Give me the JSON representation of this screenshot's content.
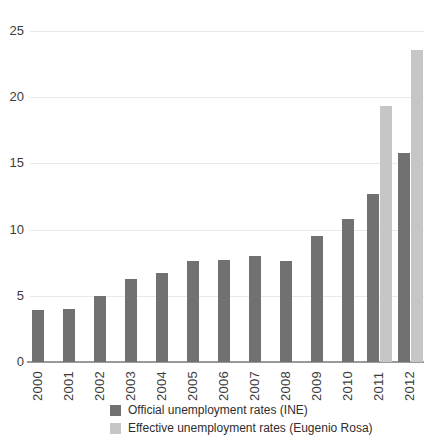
{
  "chart_data": {
    "type": "bar",
    "title": "",
    "categories": [
      "2000",
      "2001",
      "2002",
      "2003",
      "2004",
      "2005",
      "2006",
      "2007",
      "2008",
      "2009",
      "2010",
      "2011",
      "2012"
    ],
    "series": [
      {
        "name": "Official unemployment rates (INE)",
        "key": "official",
        "color": "#717171",
        "values": [
          3.9,
          4.0,
          5.0,
          6.3,
          6.7,
          7.6,
          7.7,
          8.0,
          7.6,
          9.5,
          10.8,
          12.7,
          15.8
        ]
      },
      {
        "name": "Effective unemployment rates (Eugenio Rosa)",
        "key": "effective",
        "color": "#c6c6c6",
        "values": [
          null,
          null,
          null,
          null,
          null,
          null,
          null,
          null,
          null,
          null,
          null,
          19.3,
          23.6
        ]
      }
    ],
    "xlabel": "",
    "ylabel": "",
    "yticks": [
      0,
      5,
      10,
      15,
      20,
      25
    ],
    "ylim": [
      0,
      25
    ],
    "grid": true,
    "legend_position": "bottom"
  }
}
